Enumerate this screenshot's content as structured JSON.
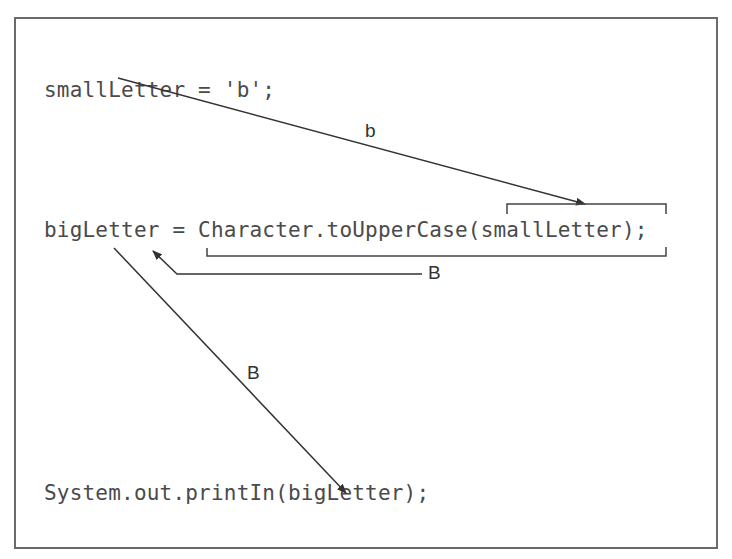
{
  "diagram": {
    "code_lines": {
      "line1": "smallLetter = 'b';",
      "line2": "bigLetter = Character.toUpperCase(smallLetter);",
      "line3": "System.out.printIn(bigLetter);"
    },
    "arrow_labels": {
      "small_to_argument": "b",
      "method_to_bigletter": "B",
      "bigletter_to_println": "B"
    },
    "colors": {
      "border": "#6a6a6a",
      "code_text": "#4a4a4a",
      "arrow": "#333333"
    }
  }
}
